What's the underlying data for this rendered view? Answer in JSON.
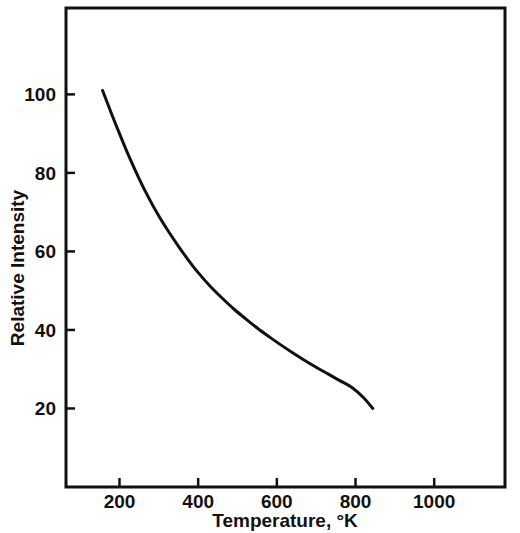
{
  "chart_data": {
    "type": "line",
    "title": "",
    "xlabel": "Temperature, °K",
    "ylabel": "Relative Intensity",
    "xlim": [
      64,
      1180
    ],
    "ylim": [
      0,
      122
    ],
    "grid": false,
    "legend": null,
    "xticks": [
      200,
      400,
      600,
      800,
      1000
    ],
    "xtick_labels": [
      "200",
      "400",
      "600",
      "800",
      "1000"
    ],
    "yticks": [
      20,
      40,
      60,
      80,
      100
    ],
    "ytick_labels": [
      "20",
      "40",
      "60",
      "80",
      "100"
    ],
    "series": [
      {
        "name": "Relative Intensity vs Temperature",
        "color": "#111111",
        "line_width": 3,
        "x": [
          157,
          180,
          200,
          225,
          250,
          275,
          300,
          325,
          350,
          375,
          400,
          430,
          460,
          490,
          520,
          550,
          580,
          610,
          640,
          670,
          700,
          730,
          760,
          790,
          820,
          844
        ],
        "y": [
          101,
          95,
          90,
          84,
          78.5,
          73.5,
          69,
          65,
          61.3,
          57.8,
          54.6,
          51.2,
          48.2,
          45.4,
          42.9,
          40.5,
          38.3,
          36.2,
          34.2,
          32.3,
          30.5,
          28.8,
          27.1,
          25.4,
          22.8,
          20
        ]
      }
    ]
  },
  "axes": {
    "frame": {
      "left": 66,
      "right": 505,
      "top": 8,
      "bottom": 487
    },
    "tick_length": 9,
    "tick_direction": "in",
    "frame_color": "#111111",
    "frame_width": 3
  },
  "labels": {
    "x_axis_title": "Temperature, °K",
    "y_axis_title": "Relative Intensity"
  }
}
